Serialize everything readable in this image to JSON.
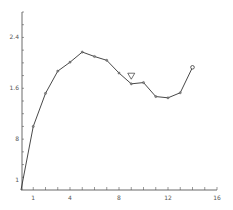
{
  "chart_data": {
    "type": "line",
    "title": "",
    "xlabel": "",
    "ylabel": "",
    "xlim": [
      0,
      16
    ],
    "ylim": [
      0,
      2.8
    ],
    "x_tick_labels": [
      {
        "value": 1,
        "label": "1"
      },
      {
        "value": 4,
        "label": "4"
      },
      {
        "value": 8,
        "label": "8"
      },
      {
        "value": 12,
        "label": "12"
      },
      {
        "value": 16,
        "label": "16"
      }
    ],
    "x_minor_ticks": [
      1,
      2,
      3,
      4,
      5,
      6,
      7,
      8,
      9,
      10,
      11,
      12,
      13,
      14,
      15,
      16
    ],
    "y_tick_labels": [
      {
        "value": 0.15,
        "label": "1"
      },
      {
        "value": 0.8,
        "label": "8"
      },
      {
        "value": 1.6,
        "label": "1.6"
      },
      {
        "value": 2.4,
        "label": "2.4"
      }
    ],
    "y_minor_step": 0.2,
    "grid": false,
    "series": [
      {
        "name": "series-1",
        "x": [
          0,
          1,
          2,
          3,
          4,
          5,
          6,
          7,
          8,
          9,
          10,
          11,
          12,
          13,
          14
        ],
        "values": [
          0.0,
          1.0,
          1.52,
          1.87,
          2.01,
          2.17,
          2.1,
          2.04,
          1.84,
          1.67,
          1.69,
          1.47,
          1.45,
          1.53,
          1.93
        ],
        "last_point_open": true
      }
    ],
    "annotations": [
      {
        "type": "triangle-down-marker",
        "x": 9,
        "y": 1.79
      }
    ]
  }
}
